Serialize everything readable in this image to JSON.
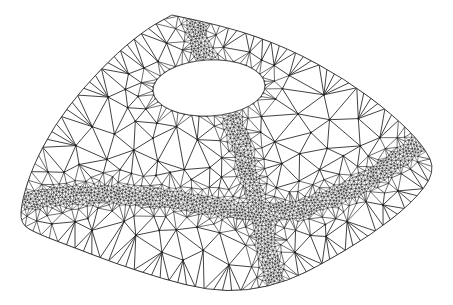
{
  "figure": {
    "background_color": "#ffffff",
    "edge_color": "#2e2e2e",
    "node_color": "#1c1c1c",
    "dense_band_color": "#3a3a3a",
    "canvas": {
      "width": 453,
      "height": 305
    }
  },
  "chart_data": {
    "type": "mesh",
    "xlabel": "",
    "ylabel": "",
    "projection": "perspective",
    "element_type": "linear-triangle",
    "domain": "curved quadrilateral patch with circular hole",
    "patch_outline_px": [
      [
        172,
        15
      ],
      [
        226,
        26
      ],
      [
        288,
        48
      ],
      [
        345,
        79
      ],
      [
        392,
        114
      ],
      [
        424,
        146
      ],
      [
        436,
        172
      ],
      [
        412,
        203
      ],
      [
        371,
        235
      ],
      [
        322,
        264
      ],
      [
        288,
        281
      ],
      [
        247,
        291
      ],
      [
        207,
        290
      ],
      [
        163,
        279
      ],
      [
        117,
        264
      ],
      [
        75,
        248
      ],
      [
        38,
        234
      ],
      [
        20,
        224
      ],
      [
        22,
        200
      ],
      [
        33,
        166
      ],
      [
        54,
        126
      ],
      [
        83,
        88
      ],
      [
        118,
        52
      ],
      [
        148,
        28
      ],
      [
        172,
        15
      ]
    ],
    "hole": {
      "shape": "ellipse",
      "center_px": [
        209,
        88
      ],
      "radius_x_px": 56,
      "radius_y_px": 28,
      "rotation_deg": -3
    },
    "refinement_bands": [
      {
        "name": "band-upper-vertical",
        "description": "dense band running from the top apex down past the left of the hole, then bending down to the cross",
        "path_px": [
          [
            193,
            16
          ],
          [
            200,
            46
          ],
          [
            215,
            80
          ],
          [
            232,
            118
          ],
          [
            243,
            152
          ],
          [
            253,
            188
          ],
          [
            262,
            222
          ],
          [
            270,
            258
          ],
          [
            276,
            286
          ]
        ],
        "half_width_px": 9,
        "darkness": 0.95
      },
      {
        "name": "band-lower-horizontal",
        "description": "dense band sweeping from the left edge across the lower half and up to the right corner",
        "path_px": [
          [
            22,
            202
          ],
          [
            58,
            196
          ],
          [
            100,
            194
          ],
          [
            142,
            196
          ],
          [
            184,
            201
          ],
          [
            224,
            208
          ],
          [
            262,
            213
          ],
          [
            300,
            209
          ],
          [
            338,
            196
          ],
          [
            374,
            177
          ],
          [
            404,
            155
          ],
          [
            428,
            136
          ]
        ],
        "half_width_px": 9,
        "darkness": 0.95
      }
    ],
    "mesh_statistics": {
      "coarse_edge_length_px": 26,
      "fine_edge_length_px": 3,
      "refinement_ratio": 8
    },
    "legend": [],
    "annotations": [],
    "grid": false
  }
}
